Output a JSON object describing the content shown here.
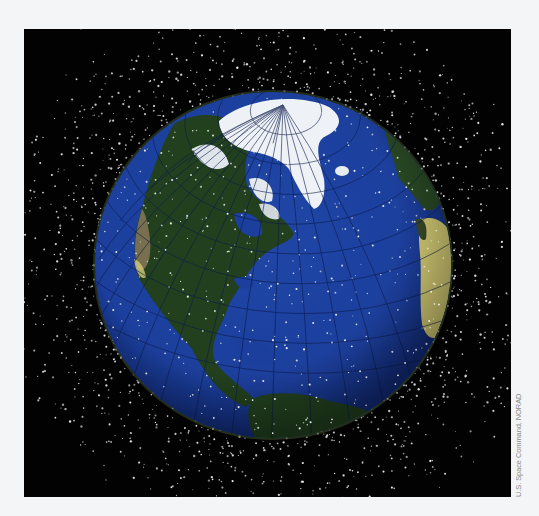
{
  "figure": {
    "credit": "U.S. Space Command, NORAD",
    "colors": {
      "page_background": "#f4f5f7",
      "space": "#020202",
      "ocean": "#1c3f9c",
      "ocean_edge": "#10286e",
      "land_dark": "#1f3a1c",
      "land_green": "#2f5a2c",
      "ice": "#eef2f6",
      "desert": "#d8cf7a",
      "debris": "#e8e8e8",
      "graticule": "#0b1a4a"
    },
    "globe": {
      "cx": 249,
      "cy": 236,
      "rx": 178,
      "ry": 173
    },
    "debris": {
      "count_outer": 1400,
      "count_on_globe": 420,
      "seed": 7
    }
  }
}
